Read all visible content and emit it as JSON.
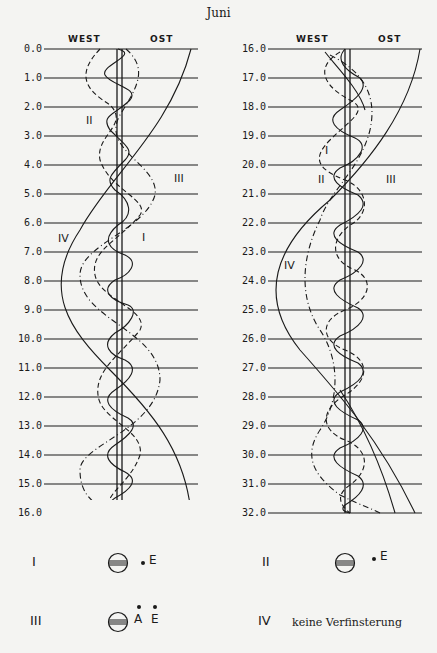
{
  "title": "Juni",
  "panels": [
    {
      "id": "left",
      "header": {
        "west": "WEST",
        "ost": "OST"
      },
      "y_labels": [
        "0.0",
        "1.0",
        "2.0",
        "3.0",
        "4.0",
        "5.0",
        "6.0",
        "7.0",
        "8.0",
        "9.0",
        "10.0",
        "11.0",
        "12.0",
        "13.0",
        "14.0",
        "15.0",
        "16.0"
      ],
      "curve_labels": [
        {
          "text": "II",
          "x": 86,
          "y": 123
        },
        {
          "text": "III",
          "x": 174,
          "y": 181
        },
        {
          "text": "I",
          "x": 142,
          "y": 240
        },
        {
          "text": "IV",
          "x": 58,
          "y": 241
        }
      ]
    },
    {
      "id": "right",
      "header": {
        "west": "WEST",
        "ost": "OST"
      },
      "y_labels": [
        "16.0",
        "17.0",
        "18.0",
        "19.0",
        "20.0",
        "21.0",
        "22.0",
        "23.0",
        "24.0",
        "25.0",
        "26.0",
        "27.0",
        "28.0",
        "29.0",
        "30.0",
        "31.0",
        "32.0"
      ],
      "curve_labels": [
        {
          "text": "I",
          "x": 325,
          "y": 153
        },
        {
          "text": "II",
          "x": 318,
          "y": 182
        },
        {
          "text": "III",
          "x": 386,
          "y": 182
        },
        {
          "text": "IV",
          "x": 284,
          "y": 268
        }
      ]
    }
  ],
  "legend": [
    {
      "id": "I",
      "numeral": "I",
      "symbol": "eclipse-end",
      "marks": [
        "E"
      ]
    },
    {
      "id": "II",
      "numeral": "II",
      "symbol": "eclipse-end",
      "marks": [
        "E"
      ]
    },
    {
      "id": "III",
      "numeral": "III",
      "symbol": "eclipse-start-end",
      "marks": [
        "A",
        "E"
      ]
    },
    {
      "id": "IV",
      "numeral": "IV",
      "text": "keine Verfinsterung"
    }
  ]
}
